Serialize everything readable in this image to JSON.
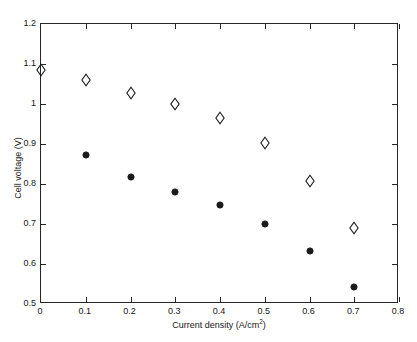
{
  "chart_data": {
    "type": "scatter",
    "title": "",
    "xlabel": "Current density (A/cm²)",
    "xlabel_base": "Current density (A/cm",
    "xlabel_sup": "2",
    "xlabel_tail": ")",
    "ylabel": "Cell voltage (V)",
    "xlim": [
      0,
      0.8
    ],
    "ylim": [
      0.5,
      1.2
    ],
    "xticks": [
      0,
      0.1,
      0.2,
      0.3,
      0.4,
      0.5,
      0.6,
      0.7,
      0.8
    ],
    "yticks": [
      0.5,
      0.6,
      0.7,
      0.8,
      0.9,
      1.0,
      1.1,
      1.2
    ],
    "xticklabels": [
      "0",
      "0.1",
      "0.2",
      "0.3",
      "0.4",
      "0.5",
      "0.6",
      "0.7",
      "0.8"
    ],
    "yticklabels": [
      "0.5",
      "0.6",
      "0.7",
      "0.8",
      "0.9",
      "1",
      "1.1",
      "1.2"
    ],
    "grid": false,
    "legend": null,
    "box": true,
    "tick_direction": "in",
    "marker_color": "#1a1a1a",
    "axis_color": "#262626",
    "background": "#ffffff",
    "series": [
      {
        "name": "open-diamond-series",
        "marker": "diamond-open",
        "color": "#1a1a1a",
        "x": [
          0.0,
          0.1,
          0.2,
          0.3,
          0.4,
          0.5,
          0.6,
          0.7
        ],
        "y": [
          1.085,
          1.06,
          1.028,
          1.0,
          0.965,
          0.903,
          0.808,
          0.69
        ]
      },
      {
        "name": "filled-circle-series",
        "marker": "circle-filled",
        "color": "#1a1a1a",
        "x": [
          0.1,
          0.2,
          0.3,
          0.4,
          0.5,
          0.6,
          0.7
        ],
        "y": [
          0.872,
          0.817,
          0.779,
          0.747,
          0.7,
          0.633,
          0.543
        ]
      }
    ]
  }
}
